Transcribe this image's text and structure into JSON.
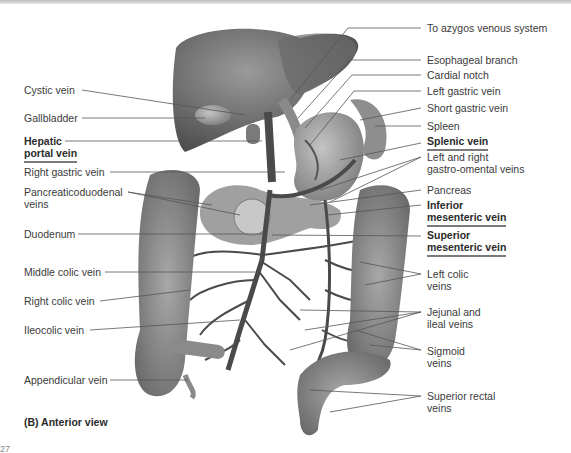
{
  "figure": {
    "caption": "(B) Anterior view",
    "footer_fragment": "27"
  },
  "labels_left": [
    {
      "id": "cystic-vein",
      "text": "Cystic vein"
    },
    {
      "id": "gallbladder",
      "text": "Gallbladder"
    },
    {
      "id": "hepatic-portal-vein",
      "line1": "Hepatic",
      "line2": "portal vein",
      "emphasis": true
    },
    {
      "id": "right-gastric-vein",
      "text": "Right gastric vein"
    },
    {
      "id": "pancreaticoduodenal-veins",
      "line1": "Pancreaticoduodenal",
      "line2": "veins"
    },
    {
      "id": "duodenum",
      "text": "Duodenum"
    },
    {
      "id": "middle-colic-vein",
      "text": "Middle colic vein"
    },
    {
      "id": "right-colic-vein",
      "text": "Right colic vein"
    },
    {
      "id": "ileocolic-vein",
      "text": "Ileocolic vein"
    },
    {
      "id": "appendicular-vein",
      "text": "Appendicular vein"
    }
  ],
  "labels_right": [
    {
      "id": "to-azygos",
      "text": "To azygos venous system"
    },
    {
      "id": "esophageal-branch",
      "text": "Esophageal branch"
    },
    {
      "id": "cardial-notch",
      "text": "Cardial notch"
    },
    {
      "id": "left-gastric-vein",
      "text": "Left gastric vein"
    },
    {
      "id": "short-gastric-vein",
      "text": "Short gastric vein"
    },
    {
      "id": "spleen",
      "text": "Spleen"
    },
    {
      "id": "splenic-vein",
      "text": "Splenic vein",
      "emphasis": true
    },
    {
      "id": "gastro-omental-veins",
      "line1": "Left and right",
      "line2": "gastro-omental veins"
    },
    {
      "id": "pancreas",
      "text": "Pancreas"
    },
    {
      "id": "inferior-mesenteric-vein",
      "line1": "Inferior",
      "line2": "mesenteric vein",
      "emphasis": true
    },
    {
      "id": "superior-mesenteric-vein",
      "line1": "Superior",
      "line2": "mesenteric vein",
      "emphasis": true
    },
    {
      "id": "left-colic-veins",
      "line1": "Left colic",
      "line2": "veins"
    },
    {
      "id": "jejunal-ileal-veins",
      "line1": "Jejunal and",
      "line2": "ileal veins"
    },
    {
      "id": "sigmoid-veins",
      "line1": "Sigmoid",
      "line2": "veins"
    },
    {
      "id": "superior-rectal-veins",
      "line1": "Superior rectal",
      "line2": "veins"
    }
  ],
  "colors": {
    "organ_fill": "#8c8c8c",
    "organ_dark": "#5a5a5a",
    "vein": "#4a4a4a",
    "leader": "#555555",
    "underline": "#7a7a7a"
  }
}
